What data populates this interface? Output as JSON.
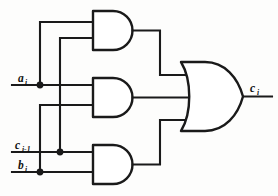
{
  "diagram": {
    "type": "logic-gate-schematic",
    "background_color": "#fdfdfc",
    "line_color": "#1a1a1a",
    "inputs": [
      {
        "id": "a_i",
        "base": "a",
        "subscript": "i",
        "label": "ai",
        "y": 85
      },
      {
        "id": "c_i-1",
        "base": "c",
        "subscript": "i-1",
        "label": "ci-1",
        "y": 152
      },
      {
        "id": "b_i",
        "base": "b",
        "subscript": "i",
        "label": "bi",
        "y": 172
      }
    ],
    "outputs": [
      {
        "id": "c_i",
        "base": "c",
        "subscript": "i",
        "label": "ci",
        "y": 96
      }
    ],
    "gates": [
      {
        "id": "and-top",
        "type": "AND",
        "inputs": [
          "a_i",
          "c_i-1"
        ],
        "output": "and-top-out"
      },
      {
        "id": "and-middle",
        "type": "AND",
        "inputs": [
          "a_i",
          "b_i"
        ],
        "output": "and-middle-out"
      },
      {
        "id": "and-bottom",
        "type": "AND",
        "inputs": [
          "c_i-1",
          "b_i"
        ],
        "output": "and-bottom-out"
      },
      {
        "id": "or-out",
        "type": "OR",
        "inputs": [
          "and-top-out",
          "and-middle-out",
          "and-bottom-out"
        ],
        "output": "c_i"
      }
    ],
    "junctions": [
      {
        "on": "a_i",
        "x": 40,
        "y": 85
      },
      {
        "on": "c_i-1",
        "x": 60,
        "y": 152
      },
      {
        "on": "b_i",
        "x": 40,
        "y": 172
      }
    ],
    "expression": "ci = (ai AND ci-1) OR (ai AND bi) OR (ci-1 AND bi)"
  }
}
